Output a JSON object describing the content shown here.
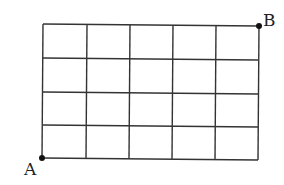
{
  "diagram": {
    "type": "grid",
    "columns": 5,
    "rows": 4,
    "line_color": "#333333",
    "points": [
      {
        "label": "A",
        "position": "bottom-left"
      },
      {
        "label": "B",
        "position": "top-right"
      }
    ]
  }
}
